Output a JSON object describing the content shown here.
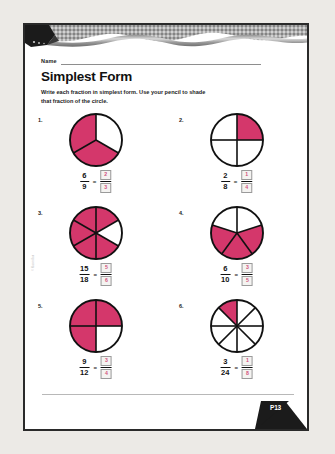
{
  "page": {
    "name_label": "Name",
    "title": "Simplest Form",
    "instructions": "Write each fraction in simplest form. Use your pencil to shade that fraction of the circle.",
    "copyright": "© Macmillan",
    "page_number": "P13"
  },
  "colors": {
    "shade": "#d4376b",
    "answer_text": "#d2507c",
    "page_border": "#2a2a2a",
    "background": "#eceae6",
    "paper": "#ffffff"
  },
  "problems": [
    {
      "number": "1.",
      "numerator": "6",
      "denominator": "9",
      "equals": "=",
      "answer_numerator": "2",
      "answer_denominator": "3",
      "circle": {
        "slices": 3,
        "shaded": [
          1,
          2
        ],
        "start_angle": -90
      }
    },
    {
      "number": "2.",
      "numerator": "2",
      "denominator": "8",
      "equals": "=",
      "answer_numerator": "1",
      "answer_denominator": "4",
      "circle": {
        "slices": 4,
        "shaded": [
          0
        ],
        "start_angle": -90
      }
    },
    {
      "number": "3.",
      "numerator": "15",
      "denominator": "18",
      "equals": "=",
      "answer_numerator": "5",
      "answer_denominator": "6",
      "circle": {
        "slices": 6,
        "shaded": [
          0,
          2,
          3,
          4,
          5
        ],
        "start_angle": -90
      }
    },
    {
      "number": "4.",
      "numerator": "6",
      "denominator": "10",
      "equals": "=",
      "answer_numerator": "3",
      "answer_denominator": "5",
      "circle": {
        "slices": 5,
        "shaded": [
          1,
          2,
          3
        ],
        "start_angle": -90
      }
    },
    {
      "number": "5.",
      "numerator": "9",
      "denominator": "12",
      "equals": "=",
      "answer_numerator": "3",
      "answer_denominator": "4",
      "circle": {
        "slices": 4,
        "shaded": [
          0,
          2,
          3
        ],
        "start_angle": -90
      }
    },
    {
      "number": "6.",
      "numerator": "3",
      "denominator": "24",
      "equals": "=",
      "answer_numerator": "1",
      "answer_denominator": "8",
      "circle": {
        "slices": 8,
        "shaded": [
          7
        ],
        "start_angle": -90
      }
    }
  ]
}
